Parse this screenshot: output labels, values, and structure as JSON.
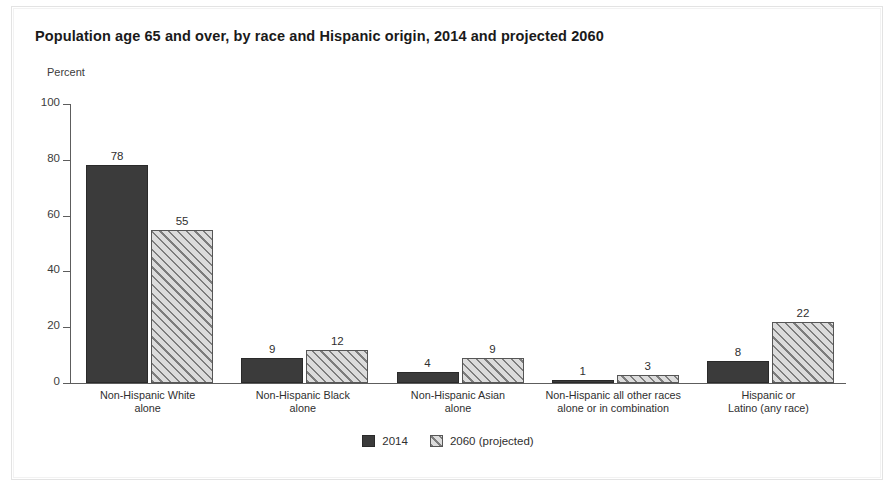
{
  "chart_data": {
    "type": "bar",
    "title": "Population age 65 and over, by race and Hispanic origin, 2014 and projected 2060",
    "xlabel": "",
    "ylabel": "Percent",
    "ylim": [
      0,
      100
    ],
    "yticks": [
      0,
      20,
      40,
      60,
      80,
      100
    ],
    "ytick_labels": [
      "0",
      "20",
      "40",
      "60",
      "80",
      "100"
    ],
    "grid": false,
    "legend_position": "bottom-center",
    "categories": [
      "Non-Hispanic White\nalone",
      "Non-Hispanic Black\nalone",
      "Non-Hispanic Asian\nalone",
      "Non-Hispanic all other races\nalone or in combination",
      "Hispanic or\nLatino (any race)"
    ],
    "series": [
      {
        "name": "2014",
        "color": "#3b3b3b",
        "fill": "solid",
        "values": [
          78,
          9,
          4,
          1,
          8
        ],
        "value_labels": [
          "78",
          "9",
          "4",
          "1",
          "8"
        ]
      },
      {
        "name": "2060 (projected)",
        "color": "#dadada",
        "fill": "diagonal-hatch",
        "values": [
          55,
          12,
          9,
          3,
          22
        ],
        "value_labels": [
          "55",
          "12",
          "9",
          "3",
          "22"
        ]
      }
    ]
  },
  "colors": {
    "series_2014": "#3b3b3b",
    "series_2060": "#dadada",
    "hatch_stroke": "#7d7d7d",
    "axis": "#5d5d5d",
    "text": "#2f2f2f",
    "background": "#ffffff"
  }
}
